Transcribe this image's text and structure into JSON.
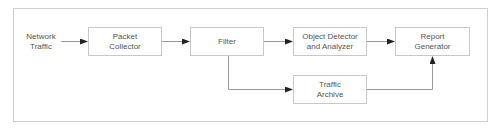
{
  "diagram": {
    "input": {
      "line1": "Network",
      "line2": "Traffic"
    },
    "nodes": {
      "packet_collector": {
        "line1": "Packet",
        "line2": "Collector"
      },
      "filter": {
        "line1": "Filter"
      },
      "object_detector": {
        "line1": "Object Detector",
        "line2": "and Analyzer"
      },
      "report_generator": {
        "line1": "Report",
        "line2": "Generator"
      },
      "traffic_archive": {
        "line1": "Traffic",
        "line2": "Archive"
      }
    },
    "edges": [
      {
        "from": "Network Traffic",
        "to": "Packet Collector"
      },
      {
        "from": "Packet Collector",
        "to": "Filter"
      },
      {
        "from": "Filter",
        "to": "Object Detector and Analyzer"
      },
      {
        "from": "Filter",
        "to": "Traffic Archive"
      },
      {
        "from": "Object Detector and Analyzer",
        "to": "Report Generator"
      },
      {
        "from": "Traffic Archive",
        "to": "Report Generator"
      }
    ],
    "colors": {
      "line": "#9a9a9a",
      "arrow": "#222222",
      "border": "#c8c8c8",
      "text": "#555555"
    }
  }
}
